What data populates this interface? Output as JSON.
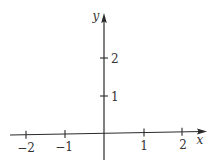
{
  "diagram": {
    "type": "cartesian-axes",
    "x_axis": {
      "label": "x",
      "ticks": [
        {
          "value": -2,
          "label": "−2"
        },
        {
          "value": -1,
          "label": "−1"
        },
        {
          "value": 1,
          "label": "1"
        },
        {
          "value": 2,
          "label": "2"
        }
      ]
    },
    "y_axis": {
      "label": "y",
      "ticks": [
        {
          "value": 1,
          "label": "1"
        },
        {
          "value": 2,
          "label": "2"
        }
      ]
    },
    "colors": {
      "axis": "#2a2a2a",
      "text": "#333333",
      "background": "#ffffff"
    }
  }
}
